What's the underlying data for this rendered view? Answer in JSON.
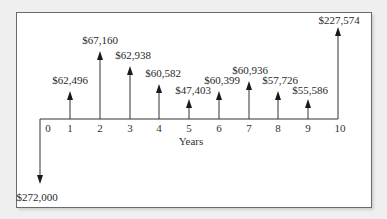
{
  "diagram": {
    "type": "cash-flow",
    "axis_label": "Years",
    "years": [
      "0",
      "1",
      "2",
      "3",
      "4",
      "5",
      "6",
      "7",
      "8",
      "9",
      "10"
    ],
    "initial_outflow": {
      "year": "0",
      "label": "$272,000",
      "value": -272000
    },
    "inflows": [
      {
        "year": "1",
        "label": "$62,496",
        "value": 62496
      },
      {
        "year": "2",
        "label": "$67,160",
        "value": 67160
      },
      {
        "year": "3",
        "label": "$62,938",
        "value": 62938
      },
      {
        "year": "4",
        "label": "$60,582",
        "value": 60582
      },
      {
        "year": "5",
        "label": "$47,403",
        "value": 47403
      },
      {
        "year": "6",
        "label": "$60,399",
        "value": 60399
      },
      {
        "year": "7",
        "label": "$60,936",
        "value": 60936
      },
      {
        "year": "8",
        "label": "$57,726",
        "value": 57726
      },
      {
        "year": "9",
        "label": "$55,586",
        "value": 55586
      },
      {
        "year": "10",
        "label": "$227,574",
        "value": 227574
      }
    ]
  }
}
